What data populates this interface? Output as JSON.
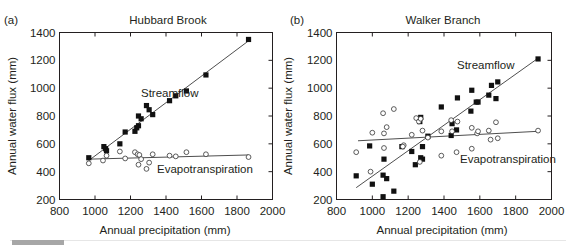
{
  "figure": {
    "panels": [
      {
        "letter": "(a)",
        "title": "Hubbard Brook",
        "xlabel": "Annual precipitation (mm)",
        "ylabel": "Annual water flux (mm)",
        "xticks": [
          "800",
          "1000",
          "1200",
          "1400",
          "1600",
          "1800",
          "2000"
        ],
        "yticks": [
          "200",
          "400",
          "600",
          "800",
          "1000",
          "1200",
          "1400"
        ],
        "series_labels": {
          "streamflow": "Streamflow",
          "evapotranspiration": "Evapotranspiration"
        }
      },
      {
        "letter": "(b)",
        "title": "Walker Branch",
        "xlabel": "Annual precipitation (mm)",
        "ylabel": "Annual water flux (mm)",
        "xticks": [
          "800",
          "1000",
          "1200",
          "1400",
          "1600",
          "1800",
          "2000"
        ],
        "yticks": [
          "200",
          "400",
          "600",
          "800",
          "1000",
          "1200",
          "1400"
        ],
        "series_labels": {
          "streamflow": "Streamflow",
          "evapotranspiration": "Evapotranspiration"
        }
      }
    ]
  },
  "chart_data": [
    {
      "type": "scatter",
      "title": "Hubbard Brook",
      "panel": "(a)",
      "xlabel": "Annual precipitation (mm)",
      "ylabel": "Annual water flux (mm)",
      "xlim": [
        800,
        2000
      ],
      "ylim": [
        200,
        1400
      ],
      "grid": false,
      "legend": "inline labels",
      "series": [
        {
          "name": "Streamflow",
          "marker": "filled square",
          "points": [
            [
              965,
              500
            ],
            [
              1050,
              580
            ],
            [
              1060,
              565
            ],
            [
              1065,
              550
            ],
            [
              1140,
              600
            ],
            [
              1170,
              685
            ],
            [
              1225,
              690
            ],
            [
              1235,
              715
            ],
            [
              1245,
              730
            ],
            [
              1245,
              800
            ],
            [
              1260,
              780
            ],
            [
              1290,
              875
            ],
            [
              1305,
              845
            ],
            [
              1325,
              810
            ],
            [
              1420,
              910
            ],
            [
              1455,
              945
            ],
            [
              1515,
              980
            ],
            [
              1625,
              1095
            ],
            [
              1865,
              1350
            ]
          ],
          "fit_line": [
            [
              965,
              480
            ],
            [
              1865,
              1340
            ]
          ]
        },
        {
          "name": "Evapotranspiration",
          "marker": "open circle",
          "points": [
            [
              965,
              460
            ],
            [
              1045,
              480
            ],
            [
              1065,
              515
            ],
            [
              1140,
              545
            ],
            [
              1170,
              495
            ],
            [
              1225,
              540
            ],
            [
              1240,
              525
            ],
            [
              1245,
              450
            ],
            [
              1250,
              520
            ],
            [
              1260,
              490
            ],
            [
              1290,
              420
            ],
            [
              1305,
              465
            ],
            [
              1325,
              525
            ],
            [
              1420,
              515
            ],
            [
              1455,
              510
            ],
            [
              1515,
              540
            ],
            [
              1625,
              525
            ],
            [
              1865,
              505
            ]
          ],
          "fit_line": [
            [
              965,
              490
            ],
            [
              1865,
              520
            ]
          ]
        }
      ]
    },
    {
      "type": "scatter",
      "title": "Walker Branch",
      "panel": "(b)",
      "xlabel": "Annual precipitation (mm)",
      "ylabel": "Annual water flux (mm)",
      "xlim": [
        800,
        2000
      ],
      "ylim": [
        200,
        1400
      ],
      "grid": false,
      "legend": "inline labels",
      "series": [
        {
          "name": "Streamflow",
          "marker": "filled square",
          "points": [
            [
              910,
              370
            ],
            [
              985,
              585
            ],
            [
              1000,
              310
            ],
            [
              1060,
              375
            ],
            [
              1065,
              490
            ],
            [
              1080,
              350
            ],
            [
              1060,
              220
            ],
            [
              1120,
              260
            ],
            [
              1165,
              580
            ],
            [
              1220,
              545
            ],
            [
              1240,
              450
            ],
            [
              1265,
              760
            ],
            [
              1270,
              790
            ],
            [
              1270,
              500
            ],
            [
              1280,
              490
            ],
            [
              1280,
              580
            ],
            [
              1310,
              655
            ],
            [
              1385,
              865
            ],
            [
              1440,
              660
            ],
            [
              1445,
              745
            ],
            [
              1470,
              700
            ],
            [
              1475,
              930
            ],
            [
              1550,
              835
            ],
            [
              1555,
              985
            ],
            [
              1580,
              900
            ],
            [
              1590,
              900
            ],
            [
              1650,
              950
            ],
            [
              1665,
              1020
            ],
            [
              1690,
              925
            ],
            [
              1700,
              1045
            ],
            [
              1925,
              1210
            ]
          ],
          "fit_line": [
            [
              910,
              285
            ],
            [
              1925,
              1215
            ]
          ]
        },
        {
          "name": "Evapotranspiration",
          "marker": "open circle",
          "points": [
            [
              910,
              540
            ],
            [
              990,
              400
            ],
            [
              1000,
              680
            ],
            [
              1060,
              820
            ],
            [
              1065,
              675
            ],
            [
              1065,
              570
            ],
            [
              1080,
              720
            ],
            [
              1120,
              850
            ],
            [
              1175,
              590
            ],
            [
              1170,
              580
            ],
            [
              1220,
              665
            ],
            [
              1245,
              785
            ],
            [
              1260,
              760
            ],
            [
              1270,
              780
            ],
            [
              1265,
              470
            ],
            [
              1280,
              695
            ],
            [
              1310,
              645
            ],
            [
              1385,
              690
            ],
            [
              1385,
              515
            ],
            [
              1440,
              770
            ],
            [
              1445,
              690
            ],
            [
              1470,
              540
            ],
            [
              1475,
              760
            ],
            [
              1555,
              715
            ],
            [
              1555,
              565
            ],
            [
              1585,
              675
            ],
            [
              1590,
              690
            ],
            [
              1650,
              695
            ],
            [
              1660,
              630
            ],
            [
              1690,
              755
            ],
            [
              1700,
              640
            ],
            [
              1925,
              695
            ]
          ],
          "fit_line": [
            [
              920,
              622
            ],
            [
              1925,
              690
            ]
          ]
        }
      ]
    }
  ]
}
